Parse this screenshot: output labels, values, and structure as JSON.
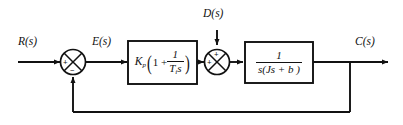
{
  "diagram": {
    "type": "control-block-diagram",
    "line_color": "#111111",
    "background": "#ffffff",
    "signals": {
      "reference": "R(s)",
      "error": "E(s)",
      "disturbance": "D(s)",
      "output": "C(s)"
    },
    "blocks": [
      {
        "id": "controller",
        "name": "pi-controller",
        "gain_label": "K",
        "gain_sub": "p",
        "expr_open_paren": "(",
        "expr_one": "1 +",
        "fraction_numerator": "1",
        "fraction_denominator_T": "T",
        "fraction_denominator_sub": "i",
        "fraction_denominator_s": "s",
        "expr_close_paren": ")",
        "expression_text": "K_p(1 + 1/(T_i s))"
      },
      {
        "id": "plant",
        "name": "plant-transfer-function",
        "numerator": "1",
        "denominator": "s(Js + b )",
        "expression_text": "1/(s(Js + b))"
      }
    ],
    "summing_junctions": [
      {
        "id": "sum-error",
        "name": "error-summing-junction",
        "input_sign": "+",
        "feedback_sign": "−"
      },
      {
        "id": "sum-disturbance",
        "name": "disturbance-summing-junction",
        "input_sign": "+",
        "disturbance_sign": "+"
      }
    ],
    "feedback": {
      "name": "unity-feedback-path",
      "gain": "1"
    }
  }
}
